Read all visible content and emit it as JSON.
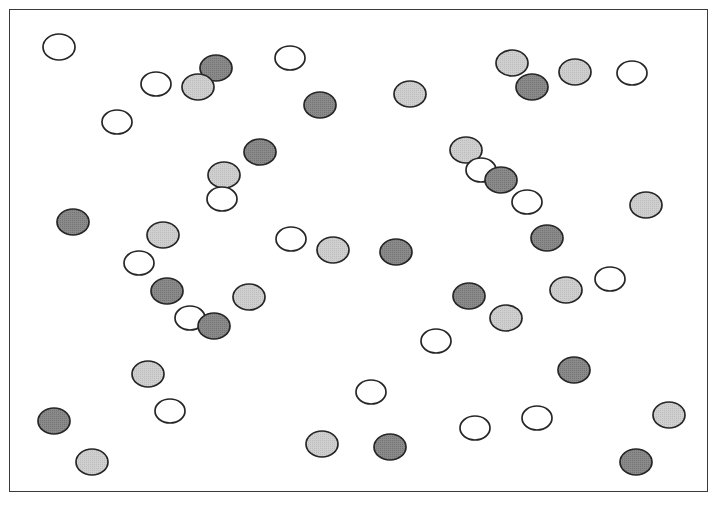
{
  "figure": {
    "width": 717,
    "height": 508,
    "background": "#ffffff",
    "frame": {
      "name": "plot-border",
      "x": 9,
      "y": 9,
      "width": 699,
      "height": 483,
      "stroke": "#3a3a3a",
      "stroke_width": 1.6,
      "fill": "#ffffff"
    }
  },
  "legend_colors": {
    "white": "#ffffff",
    "light_gray": "#c9c9c9",
    "dark_gray": "#808080",
    "outline": "#262626"
  },
  "chart_data": {
    "type": "scatter",
    "title": "",
    "subtitle": "",
    "xlabel": "",
    "ylabel": "",
    "xlim": [
      0,
      717
    ],
    "ylim": [
      0,
      508
    ],
    "grid": false,
    "legend": "none",
    "axis_ticks": false,
    "marker_shape": "ellipse",
    "marker_rx": 15,
    "marker_ry": 12,
    "categories": [
      "white",
      "light_gray",
      "dark_gray"
    ],
    "counts": {
      "white": 20,
      "light_gray": 16,
      "dark_gray": 19,
      "total": 55
    },
    "points": [
      {
        "x": 59,
        "y": 47,
        "rx": 16,
        "ry": 13,
        "fill": "white"
      },
      {
        "x": 156,
        "y": 84,
        "rx": 15,
        "ry": 12,
        "fill": "white"
      },
      {
        "x": 216,
        "y": 68,
        "rx": 16,
        "ry": 13,
        "fill": "dark_gray"
      },
      {
        "x": 198,
        "y": 87,
        "rx": 16,
        "ry": 13,
        "fill": "light_gray"
      },
      {
        "x": 290,
        "y": 58,
        "rx": 15,
        "ry": 12,
        "fill": "white"
      },
      {
        "x": 117,
        "y": 122,
        "rx": 15,
        "ry": 12,
        "fill": "white"
      },
      {
        "x": 320,
        "y": 105,
        "rx": 16,
        "ry": 13,
        "fill": "dark_gray"
      },
      {
        "x": 410,
        "y": 94,
        "rx": 16,
        "ry": 13,
        "fill": "light_gray"
      },
      {
        "x": 512,
        "y": 63,
        "rx": 16,
        "ry": 13,
        "fill": "light_gray"
      },
      {
        "x": 532,
        "y": 87,
        "rx": 16,
        "ry": 13,
        "fill": "dark_gray"
      },
      {
        "x": 575,
        "y": 72,
        "rx": 16,
        "ry": 13,
        "fill": "light_gray"
      },
      {
        "x": 632,
        "y": 73,
        "rx": 15,
        "ry": 12,
        "fill": "white"
      },
      {
        "x": 260,
        "y": 152,
        "rx": 16,
        "ry": 13,
        "fill": "dark_gray"
      },
      {
        "x": 224,
        "y": 175,
        "rx": 16,
        "ry": 13,
        "fill": "light_gray"
      },
      {
        "x": 222,
        "y": 199,
        "rx": 15,
        "ry": 12,
        "fill": "white"
      },
      {
        "x": 466,
        "y": 150,
        "rx": 16,
        "ry": 13,
        "fill": "light_gray"
      },
      {
        "x": 481,
        "y": 170,
        "rx": 15,
        "ry": 12,
        "fill": "white"
      },
      {
        "x": 501,
        "y": 180,
        "rx": 16,
        "ry": 13,
        "fill": "dark_gray"
      },
      {
        "x": 527,
        "y": 202,
        "rx": 15,
        "ry": 12,
        "fill": "white"
      },
      {
        "x": 646,
        "y": 205,
        "rx": 16,
        "ry": 13,
        "fill": "light_gray"
      },
      {
        "x": 73,
        "y": 222,
        "rx": 16,
        "ry": 13,
        "fill": "dark_gray"
      },
      {
        "x": 163,
        "y": 235,
        "rx": 16,
        "ry": 13,
        "fill": "light_gray"
      },
      {
        "x": 291,
        "y": 239,
        "rx": 15,
        "ry": 12,
        "fill": "white"
      },
      {
        "x": 333,
        "y": 250,
        "rx": 16,
        "ry": 13,
        "fill": "light_gray"
      },
      {
        "x": 396,
        "y": 252,
        "rx": 16,
        "ry": 13,
        "fill": "dark_gray"
      },
      {
        "x": 547,
        "y": 238,
        "rx": 16,
        "ry": 13,
        "fill": "dark_gray"
      },
      {
        "x": 139,
        "y": 263,
        "rx": 15,
        "ry": 12,
        "fill": "white"
      },
      {
        "x": 167,
        "y": 291,
        "rx": 16,
        "ry": 13,
        "fill": "dark_gray"
      },
      {
        "x": 249,
        "y": 297,
        "rx": 16,
        "ry": 13,
        "fill": "light_gray"
      },
      {
        "x": 469,
        "y": 296,
        "rx": 16,
        "ry": 13,
        "fill": "dark_gray"
      },
      {
        "x": 566,
        "y": 290,
        "rx": 16,
        "ry": 13,
        "fill": "light_gray"
      },
      {
        "x": 610,
        "y": 279,
        "rx": 15,
        "ry": 12,
        "fill": "white"
      },
      {
        "x": 190,
        "y": 318,
        "rx": 15,
        "ry": 12,
        "fill": "white"
      },
      {
        "x": 214,
        "y": 326,
        "rx": 16,
        "ry": 13,
        "fill": "dark_gray"
      },
      {
        "x": 506,
        "y": 318,
        "rx": 16,
        "ry": 13,
        "fill": "light_gray"
      },
      {
        "x": 436,
        "y": 341,
        "rx": 15,
        "ry": 12,
        "fill": "white"
      },
      {
        "x": 148,
        "y": 374,
        "rx": 16,
        "ry": 13,
        "fill": "light_gray"
      },
      {
        "x": 574,
        "y": 370,
        "rx": 16,
        "ry": 13,
        "fill": "dark_gray"
      },
      {
        "x": 371,
        "y": 392,
        "rx": 15,
        "ry": 12,
        "fill": "white"
      },
      {
        "x": 54,
        "y": 421,
        "rx": 16,
        "ry": 13,
        "fill": "dark_gray"
      },
      {
        "x": 170,
        "y": 411,
        "rx": 15,
        "ry": 12,
        "fill": "white"
      },
      {
        "x": 475,
        "y": 428,
        "rx": 15,
        "ry": 12,
        "fill": "white"
      },
      {
        "x": 537,
        "y": 418,
        "rx": 15,
        "ry": 12,
        "fill": "white"
      },
      {
        "x": 669,
        "y": 415,
        "rx": 16,
        "ry": 13,
        "fill": "light_gray"
      },
      {
        "x": 322,
        "y": 444,
        "rx": 16,
        "ry": 13,
        "fill": "light_gray"
      },
      {
        "x": 390,
        "y": 447,
        "rx": 16,
        "ry": 13,
        "fill": "dark_gray"
      },
      {
        "x": 636,
        "y": 462,
        "rx": 16,
        "ry": 13,
        "fill": "dark_gray"
      },
      {
        "x": 92,
        "y": 462,
        "rx": 16,
        "ry": 13,
        "fill": "light_gray"
      }
    ]
  }
}
